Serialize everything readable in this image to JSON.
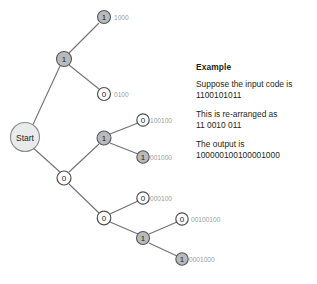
{
  "diagram": {
    "start_node": {
      "label": "Start"
    },
    "nodes": [
      {
        "id": "n1",
        "label": "1",
        "type": "one",
        "cx": 64,
        "cy": 59,
        "r": 7.5,
        "code": ""
      },
      {
        "id": "n1_1",
        "label": "1",
        "type": "one",
        "cx": 104,
        "cy": 17,
        "r": 6.5,
        "code": "1000"
      },
      {
        "id": "n1_0",
        "label": "0",
        "type": "zero",
        "cx": 104,
        "cy": 94,
        "r": 6.5,
        "code": "0100"
      },
      {
        "id": "n0",
        "label": "0",
        "type": "zero",
        "cx": 64,
        "cy": 178,
        "r": 7.0,
        "code": ""
      },
      {
        "id": "n0_1",
        "label": "1",
        "type": "one",
        "cx": 104,
        "cy": 138,
        "r": 7.0,
        "code": ""
      },
      {
        "id": "n0_1_0",
        "label": "0",
        "type": "zero",
        "cx": 143,
        "cy": 120,
        "r": 6.2,
        "code": "100100"
      },
      {
        "id": "n0_1_1",
        "label": "1",
        "type": "one",
        "cx": 143,
        "cy": 157,
        "r": 6.2,
        "code": "001000"
      },
      {
        "id": "n0_0",
        "label": "0",
        "type": "zero",
        "cx": 104,
        "cy": 218,
        "r": 6.8,
        "code": ""
      },
      {
        "id": "n0_0_0",
        "label": "0",
        "type": "zero",
        "cx": 143,
        "cy": 198,
        "r": 6.2,
        "code": "000100"
      },
      {
        "id": "n0_0_1",
        "label": "1",
        "type": "one",
        "cx": 143,
        "cy": 238,
        "r": 6.5,
        "code": ""
      },
      {
        "id": "n0_0_1_0",
        "label": "0",
        "type": "zero",
        "cx": 182,
        "cy": 219,
        "r": 6.2,
        "code": "00100100"
      },
      {
        "id": "n0_0_1_1",
        "label": "1",
        "type": "one",
        "cx": 182,
        "cy": 259,
        "r": 6.2,
        "code": "0001000"
      }
    ],
    "labels": {
      "leaf_1000": "1000",
      "leaf_0100": "0100",
      "leaf_100100": "100100",
      "leaf_001000": "001000",
      "leaf_000100": "000100",
      "leaf_00100100": "00100100",
      "leaf_0001000": "0001000"
    },
    "colors": {
      "node_one_fill": "#b9babb",
      "node_zero_fill": "#fdfdfd",
      "start_fill": "#e9eaeb",
      "edge": "#6f7173",
      "code_label": "#9a9c9e",
      "text": "#231f20"
    }
  },
  "panel": {
    "heading": "Example",
    "block1_line1": "Suppose the input code is",
    "block1_line2": "1100101011",
    "block2_line1": "This is re-arranged as",
    "block2_line2": "11 0010 011",
    "block3_line1": "The output is",
    "block3_line2": "100000100100001000"
  }
}
